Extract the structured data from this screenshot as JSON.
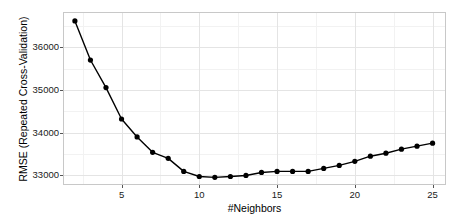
{
  "chart_data": {
    "type": "line",
    "title": "",
    "subtitle": "",
    "xlabel": "#Neighbors",
    "ylabel": "RMSE (Repeated Cross-Validation)",
    "x": [
      2,
      3,
      4,
      5,
      6,
      7,
      8,
      9,
      10,
      11,
      12,
      13,
      14,
      15,
      16,
      17,
      18,
      19,
      20,
      21,
      22,
      23,
      24,
      25
    ],
    "values": [
      36615,
      35700,
      35055,
      34320,
      33900,
      33540,
      33400,
      33095,
      32975,
      32955,
      32975,
      33000,
      33070,
      33095,
      33095,
      33095,
      33165,
      33235,
      33330,
      33450,
      33520,
      33615,
      33685,
      33755
    ],
    "series": [
      {
        "name": "RMSE",
        "values": [
          36615,
          35700,
          35055,
          34320,
          33900,
          33540,
          33400,
          33095,
          32975,
          32955,
          32975,
          33000,
          33070,
          33095,
          33095,
          33095,
          33165,
          33235,
          33330,
          33450,
          33520,
          33615,
          33685,
          33755
        ]
      }
    ],
    "xlim": [
      1.3,
      25.8
    ],
    "ylim": [
      32800,
      36800
    ],
    "xticks": [
      5,
      10,
      15,
      20,
      25
    ],
    "xtick_labels": [
      "5",
      "10",
      "15",
      "20",
      "25"
    ],
    "yticks": [
      33000,
      34000,
      35000,
      36000
    ],
    "ytick_labels": [
      "33000",
      "34000",
      "35000",
      "36000"
    ],
    "grid": true,
    "grid_minor": true,
    "legend": false,
    "legend_position": "none",
    "marker": "filled-circle",
    "line_color": "#000000",
    "point_color": "#000000",
    "grid_color": "#e4e4e4",
    "minor_grid_color": "#f2f2f2",
    "panel_background": "#ffffff",
    "panel_border_color": "#c8c8c8",
    "annotations": []
  }
}
